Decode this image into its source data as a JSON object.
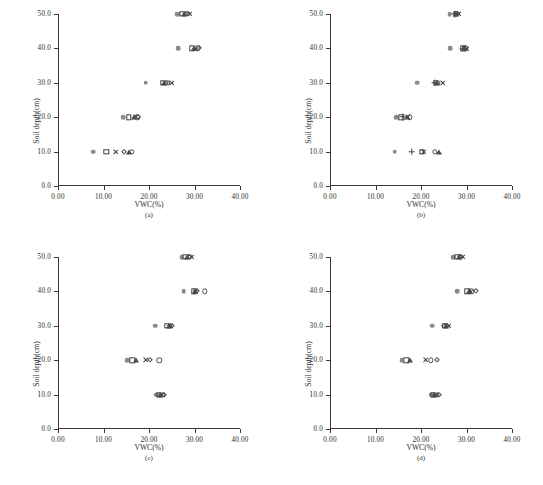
{
  "figure": {
    "caption_fragment": "",
    "axis": {
      "ylabel": "Soil depth(cm)",
      "xlabel": "VWC(%)",
      "yticks": [
        "0.0",
        "10.0",
        "20.0",
        "30.0",
        "40.0",
        "50.0"
      ],
      "ytick_values": [
        0,
        10,
        20,
        30,
        40,
        50
      ],
      "xticks": [
        "0.00",
        "10.00",
        "20.00",
        "30.00",
        "40.00"
      ],
      "xtick_values": [
        0,
        10,
        20,
        30,
        40
      ],
      "xlim": [
        0,
        40
      ],
      "ylim": [
        0,
        50
      ]
    }
  },
  "chart_data": [
    {
      "type": "scatter",
      "panel": "(a)",
      "title": "",
      "xlabel": "VWC(%)",
      "ylabel": "Soil depth(cm)",
      "xlim": [
        0,
        40
      ],
      "ylim": [
        0,
        50
      ],
      "grid": false,
      "legend": "none",
      "series": [
        {
          "name": "filled-circle",
          "marker": "filled-circle",
          "points": [
            [
              7.8,
              10
            ],
            [
              14.3,
              20
            ],
            [
              19.3,
              30
            ],
            [
              26.4,
              40
            ],
            [
              26.2,
              50
            ]
          ]
        },
        {
          "name": "open-square",
          "marker": "open-square",
          "points": [
            [
              10.6,
              10
            ],
            [
              15.6,
              20
            ],
            [
              23.1,
              30
            ],
            [
              29.4,
              40
            ],
            [
              27.3,
              50
            ]
          ]
        },
        {
          "name": "cross",
          "marker": "cross",
          "points": [
            [
              12.6,
              10
            ],
            [
              17.1,
              20
            ],
            [
              25.0,
              30
            ],
            [
              30.3,
              40
            ],
            [
              28.9,
              50
            ]
          ]
        },
        {
          "name": "open-diamond",
          "marker": "open-diamond",
          "points": [
            [
              14.4,
              10
            ],
            [
              17.6,
              20
            ],
            [
              23.7,
              30
            ],
            [
              30.9,
              40
            ],
            [
              28.1,
              50
            ]
          ]
        },
        {
          "name": "filled-triangle",
          "marker": "filled-triangle",
          "points": [
            [
              15.6,
              10
            ],
            [
              16.8,
              20
            ],
            [
              23.4,
              30
            ],
            [
              29.9,
              40
            ],
            [
              27.8,
              50
            ]
          ]
        },
        {
          "name": "open-circle",
          "marker": "open-circle",
          "points": [
            [
              16.2,
              10
            ],
            [
              17.4,
              20
            ],
            [
              24.1,
              30
            ],
            [
              30.6,
              40
            ],
            [
              28.5,
              50
            ]
          ]
        }
      ]
    },
    {
      "type": "scatter",
      "panel": "(b)",
      "title": "",
      "xlabel": "VWC(%)",
      "ylabel": "Soil depth(cm)",
      "xlim": [
        0,
        40
      ],
      "ylim": [
        0,
        50
      ],
      "grid": false,
      "legend": "none",
      "series": [
        {
          "name": "filled-circle",
          "marker": "filled-circle",
          "points": [
            [
              14.2,
              10
            ],
            [
              14.5,
              20
            ],
            [
              19.2,
              30
            ],
            [
              26.4,
              40
            ],
            [
              26.3,
              50
            ]
          ]
        },
        {
          "name": "plus",
          "marker": "plus",
          "points": [
            [
              18.0,
              10
            ],
            [
              15.9,
              20
            ],
            [
              23.0,
              30
            ],
            [
              29.2,
              40
            ],
            [
              27.4,
              50
            ]
          ]
        },
        {
          "name": "open-square",
          "marker": "open-square",
          "points": [
            [
              20.2,
              10
            ],
            [
              15.7,
              20
            ],
            [
              23.3,
              30
            ],
            [
              29.3,
              40
            ],
            [
              27.6,
              50
            ]
          ]
        },
        {
          "name": "cross",
          "marker": "cross",
          "points": [
            [
              20.6,
              10
            ],
            [
              17.2,
              20
            ],
            [
              24.9,
              30
            ],
            [
              30.0,
              40
            ],
            [
              28.3,
              50
            ]
          ]
        },
        {
          "name": "open-circle",
          "marker": "open-circle",
          "points": [
            [
              23.1,
              10
            ],
            [
              17.5,
              20
            ],
            [
              23.7,
              30
            ],
            [
              29.7,
              40
            ],
            [
              27.9,
              50
            ]
          ]
        },
        {
          "name": "filled-triangle",
          "marker": "filled-triangle",
          "points": [
            [
              23.9,
              10
            ],
            [
              17.0,
              20
            ],
            [
              23.5,
              30
            ],
            [
              29.5,
              40
            ],
            [
              27.7,
              50
            ]
          ]
        }
      ]
    },
    {
      "type": "scatter",
      "panel": "(c)",
      "title": "",
      "xlabel": "VWC(%)",
      "ylabel": "Soil depth(cm)",
      "xlim": [
        0,
        40
      ],
      "ylim": [
        0,
        50
      ],
      "grid": false,
      "legend": "none",
      "series": [
        {
          "name": "filled-circle",
          "marker": "filled-circle",
          "points": [
            [
              21.6,
              10
            ],
            [
              15.2,
              20
            ],
            [
              21.4,
              30
            ],
            [
              27.6,
              40
            ],
            [
              27.2,
              50
            ]
          ]
        },
        {
          "name": "open-square",
          "marker": "open-square",
          "points": [
            [
              22.1,
              10
            ],
            [
              16.3,
              20
            ],
            [
              24.0,
              30
            ],
            [
              29.8,
              40
            ],
            [
              28.0,
              50
            ]
          ]
        },
        {
          "name": "filled-triangle",
          "marker": "filled-triangle",
          "points": [
            [
              22.4,
              10
            ],
            [
              17.2,
              20
            ],
            [
              24.4,
              30
            ],
            [
              30.0,
              40
            ],
            [
              28.3,
              50
            ]
          ]
        },
        {
          "name": "cross",
          "marker": "cross",
          "points": [
            [
              22.8,
              10
            ],
            [
              19.3,
              20
            ],
            [
              24.8,
              30
            ],
            [
              30.3,
              40
            ],
            [
              29.5,
              50
            ]
          ]
        },
        {
          "name": "open-diamond",
          "marker": "open-diamond",
          "points": [
            [
              23.4,
              10
            ],
            [
              20.3,
              20
            ],
            [
              25.1,
              30
            ],
            [
              30.6,
              40
            ],
            [
              28.7,
              50
            ]
          ]
        },
        {
          "name": "open-circle",
          "marker": "open-circle",
          "points": [
            [
              23.0,
              10
            ],
            [
              22.3,
              20
            ],
            [
              24.6,
              30
            ],
            [
              32.2,
              40
            ],
            [
              29.0,
              50
            ]
          ]
        }
      ]
    },
    {
      "type": "scatter",
      "panel": "(d)",
      "title": "",
      "xlabel": "VWC(%)",
      "ylabel": "Soil depth(cm)",
      "xlim": [
        0,
        40
      ],
      "ylim": [
        0,
        50
      ],
      "grid": false,
      "legend": "none",
      "series": [
        {
          "name": "filled-circle",
          "marker": "filled-circle",
          "points": [
            [
              22.2,
              10
            ],
            [
              15.8,
              20
            ],
            [
              22.4,
              30
            ],
            [
              28.0,
              40
            ],
            [
              27.1,
              50
            ]
          ]
        },
        {
          "name": "open-square",
          "marker": "open-square",
          "points": [
            [
              22.6,
              10
            ],
            [
              16.8,
              20
            ],
            [
              25.2,
              30
            ],
            [
              30.2,
              40
            ],
            [
              28.0,
              50
            ]
          ]
        },
        {
          "name": "filled-triangle",
          "marker": "filled-triangle",
          "points": [
            [
              22.9,
              10
            ],
            [
              17.6,
              20
            ],
            [
              25.5,
              30
            ],
            [
              30.5,
              40
            ],
            [
              28.3,
              50
            ]
          ]
        },
        {
          "name": "cross",
          "marker": "cross",
          "points": [
            [
              23.3,
              10
            ],
            [
              21.0,
              20
            ],
            [
              26.1,
              30
            ],
            [
              30.9,
              40
            ],
            [
              29.1,
              50
            ]
          ]
        },
        {
          "name": "open-diamond",
          "marker": "open-diamond",
          "points": [
            [
              23.9,
              10
            ],
            [
              23.6,
              20
            ],
            [
              25.8,
              30
            ],
            [
              32.0,
              40
            ],
            [
              28.6,
              50
            ]
          ]
        },
        {
          "name": "open-circle",
          "marker": "open-circle",
          "points": [
            [
              23.5,
              10
            ],
            [
              22.2,
              20
            ],
            [
              25.0,
              30
            ],
            [
              31.1,
              40
            ],
            [
              28.8,
              50
            ]
          ]
        }
      ]
    }
  ]
}
